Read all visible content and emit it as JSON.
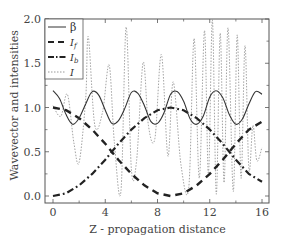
{
  "chart_data": {
    "type": "line",
    "title": "",
    "xlabel": "Z - propagation distance",
    "ylabel": "Wavevector and intensities",
    "xlim": [
      -0.6,
      16.5
    ],
    "ylim": [
      -0.08,
      2.0
    ],
    "xticks": [
      0,
      4,
      8,
      12,
      16
    ],
    "yticks": [
      0.0,
      0.5,
      1.0,
      1.5,
      2.0
    ],
    "xtick_labels": [
      "0",
      "4",
      "8",
      "12",
      "16"
    ],
    "ytick_labels": [
      "0.0",
      "0.5",
      "1.0",
      "1.5",
      "2.0"
    ],
    "grid": false,
    "legend_position": "upper left",
    "legend": [
      "β",
      "I_f",
      "I_b",
      "I"
    ],
    "series": [
      {
        "name": "β",
        "style": "solid",
        "color": "#333333",
        "x": [
          0,
          0.5,
          1,
          1.5,
          2,
          2.5,
          3,
          3.5,
          4,
          4.5,
          5,
          5.5,
          6,
          6.5,
          7,
          7.5,
          8,
          8.5,
          9,
          9.5,
          10,
          10.5,
          11,
          11.5,
          12,
          12.5,
          13,
          13.5,
          14,
          14.5,
          15,
          15.5,
          16
        ],
        "values": [
          1.19,
          1.1,
          0.92,
          0.81,
          0.88,
          1.04,
          1.18,
          1.14,
          0.97,
          0.82,
          0.85,
          0.99,
          1.17,
          1.16,
          1.02,
          0.84,
          0.82,
          0.94,
          1.15,
          1.18,
          1.07,
          0.87,
          0.81,
          0.9,
          1.12,
          1.19,
          1.11,
          0.92,
          0.81,
          0.87,
          1.04,
          1.18,
          1.15
        ]
      },
      {
        "name": "I_f",
        "style": "dashed",
        "color": "#222222",
        "x": [
          0,
          1,
          2,
          3,
          4,
          4.5,
          5,
          6,
          7,
          8,
          9,
          10,
          11,
          12,
          13,
          13.5,
          14,
          15,
          16
        ],
        "values": [
          1.0,
          0.97,
          0.88,
          0.75,
          0.59,
          0.5,
          0.41,
          0.25,
          0.12,
          0.03,
          0.0,
          0.03,
          0.12,
          0.25,
          0.41,
          0.5,
          0.59,
          0.75,
          0.84
        ]
      },
      {
        "name": "I_b",
        "style": "dashdot",
        "color": "#222222",
        "x": [
          0,
          1,
          2,
          3,
          4,
          4.5,
          5,
          6,
          7,
          8,
          9,
          10,
          11,
          12,
          13,
          13.5,
          14,
          15,
          16
        ],
        "values": [
          0.0,
          0.03,
          0.12,
          0.25,
          0.41,
          0.5,
          0.59,
          0.75,
          0.88,
          0.97,
          1.0,
          0.97,
          0.88,
          0.75,
          0.59,
          0.5,
          0.41,
          0.25,
          0.16
        ]
      },
      {
        "name": "I",
        "style": "dotted",
        "color": "#999999",
        "x": [
          0,
          0.6,
          1.1,
          1.6,
          2.0,
          2.5,
          2.7,
          3.2,
          3.8,
          4.3,
          4.7,
          5.2,
          5.6,
          6.0,
          6.4,
          6.9,
          7.3,
          7.8,
          8.3,
          8.8,
          9.2,
          9.8,
          10.4,
          10.8,
          11.2,
          11.6,
          11.9,
          12.2,
          12.5,
          12.8,
          13.1,
          13.4,
          13.8,
          14.1,
          14.4,
          14.7,
          15.0,
          15.3,
          15.6,
          16.0
        ],
        "values": [
          1.02,
          0.9,
          1.15,
          0.6,
          0.38,
          1.1,
          1.8,
          0.8,
          0.95,
          1.48,
          0.6,
          0.05,
          1.91,
          0.3,
          0.4,
          1.51,
          0.8,
          0.65,
          1.6,
          0.45,
          1.29,
          0.35,
          0.1,
          1.78,
          0.2,
          1.87,
          0.25,
          1.99,
          0.02,
          1.84,
          0.15,
          1.9,
          0.05,
          1.82,
          0.2,
          1.7,
          0.3,
          0.8,
          0.4,
          0.55
        ]
      }
    ]
  },
  "axes": {
    "xlabel_text": "Z - propagation distance",
    "ylabel_text": "Wavevector and intensities"
  },
  "legend": {
    "items": [
      {
        "label": "β",
        "style": "solid"
      },
      {
        "label": "If",
        "style": "dashed"
      },
      {
        "label": "Ib",
        "style": "dashdot"
      },
      {
        "label": "I",
        "style": "dotted"
      }
    ]
  }
}
